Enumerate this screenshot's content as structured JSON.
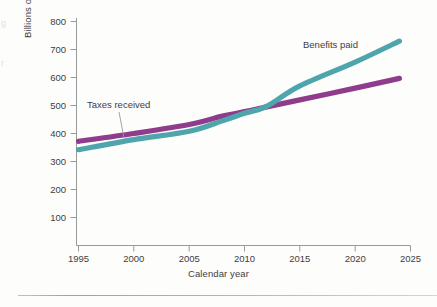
{
  "figure": {
    "background": "#fdfdfc",
    "margin_bleed": [
      "g",
      "r"
    ],
    "bottom_rule_color": "#e8796a"
  },
  "axes": {
    "y_title": "Billions of constant dollars",
    "x_title": "Calendar year",
    "y_ticks": [
      "800",
      "700",
      "600",
      "500",
      "400",
      "300",
      "200",
      "100"
    ],
    "x_ticks": [
      "1995",
      "2000",
      "2005",
      "2010",
      "2015",
      "2020",
      "2025"
    ]
  },
  "annotations": {
    "benefits_label": "Benefits paid",
    "taxes_label": "Taxes received"
  },
  "chart_data": {
    "type": "line",
    "title": "",
    "subtitle": "",
    "xlabel": "Calendar year",
    "ylabel": "Billions of constant dollars",
    "xlim": [
      1995,
      2025
    ],
    "ylim": [
      0,
      800
    ],
    "y_tick_values": [
      100,
      200,
      300,
      400,
      500,
      600,
      700,
      800
    ],
    "x_tick_values": [
      1995,
      2000,
      2005,
      2010,
      2015,
      2020,
      2025
    ],
    "grid": false,
    "legend_position": "inline-annotations",
    "x": [
      1995,
      2000,
      2005,
      2008,
      2010,
      2012,
      2015,
      2020,
      2024
    ],
    "series": [
      {
        "name": "Taxes received",
        "color": "#8e3c8b",
        "values": [
          372,
          400,
          432,
          462,
          478,
          495,
          520,
          562,
          597
        ],
        "annotation": "Taxes received"
      },
      {
        "name": "Benefits paid",
        "color": "#4fa5ac",
        "values": [
          342,
          378,
          408,
          445,
          472,
          497,
          570,
          655,
          730
        ],
        "annotation": "Benefits paid"
      }
    ],
    "crossover": {
      "year": 2012,
      "value": 495
    }
  }
}
